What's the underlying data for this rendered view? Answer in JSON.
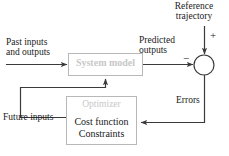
{
  "diagram": {
    "type": "control-block-diagram",
    "colors": {
      "line": "#3a3a3a",
      "text": "#1a1a1a",
      "ghost_text": "#c8c8c8",
      "box_border": "#b4b4b4",
      "background": "#ffffff"
    },
    "blocks": [
      {
        "id": "system-model",
        "title": "System model",
        "title_style": "ghost",
        "x": 68,
        "y": 53,
        "w": 75,
        "h": 23
      },
      {
        "id": "optimizer",
        "title": "Optimizer",
        "title_style": "ghost",
        "lines": [
          "Cost function",
          "Constraints"
        ],
        "x": 66,
        "y": 96,
        "w": 71,
        "h": 49
      }
    ],
    "summing_junction": {
      "id": "summing-junction",
      "cx": 204,
      "cy": 65,
      "r": 10,
      "plus": "+",
      "minus": "−"
    },
    "labels": {
      "reference_trajectory": "Reference\ntrajectory",
      "reference_trajectory_line1": "Reference",
      "reference_trajectory_line2": "trajectory",
      "past_inputs_line1": "Past inputs",
      "past_inputs_line2": "and outputs",
      "predicted_outputs_line1": "Predicted",
      "predicted_outputs_line2": "outputs",
      "errors": "Errors",
      "future_inputs": "Future inputs",
      "system_model": "System model",
      "optimizer": "Optimizer",
      "cost_function": "Cost function",
      "constraints": "Constraints"
    },
    "signals": [
      {
        "name": "past-inputs-and-outputs",
        "from": "external-left",
        "to": "system-model"
      },
      {
        "name": "predicted-outputs",
        "from": "system-model",
        "to": "summing-junction"
      },
      {
        "name": "reference-trajectory",
        "from": "external-top",
        "to": "summing-junction"
      },
      {
        "name": "errors",
        "from": "summing-junction",
        "to": "optimizer"
      },
      {
        "name": "future-inputs",
        "from": "optimizer",
        "to": "system-model"
      }
    ]
  }
}
